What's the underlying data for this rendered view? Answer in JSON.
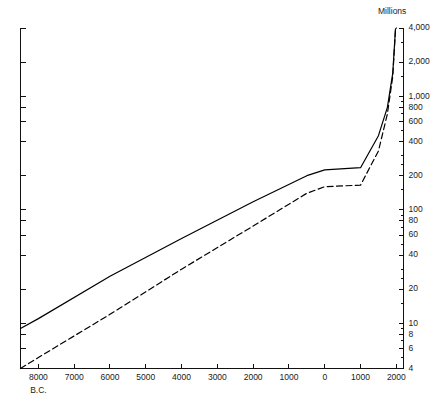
{
  "chart_data": {
    "type": "line",
    "title": "",
    "subtitle": "",
    "xlabel": "",
    "ylabel": "Millions",
    "yscale": "log",
    "ylim": [
      4,
      4000
    ],
    "xlim": [
      -8500,
      2200
    ],
    "grid": false,
    "legend_position": "none",
    "y_unit_label": "Millions",
    "era_label": "B.C.",
    "y_ticks": [
      {
        "value": 4000,
        "label": "4,000"
      },
      {
        "value": 2000,
        "label": "2,000"
      },
      {
        "value": 1000,
        "label": "1,000"
      },
      {
        "value": 800,
        "label": "800"
      },
      {
        "value": 600,
        "label": "600"
      },
      {
        "value": 400,
        "label": "400"
      },
      {
        "value": 200,
        "label": "200"
      },
      {
        "value": 100,
        "label": "100"
      },
      {
        "value": 80,
        "label": "80"
      },
      {
        "value": 60,
        "label": "60"
      },
      {
        "value": 40,
        "label": "40"
      },
      {
        "value": 20,
        "label": "20"
      },
      {
        "value": 10,
        "label": "10"
      },
      {
        "value": 8,
        "label": "8"
      },
      {
        "value": 6,
        "label": "6"
      },
      {
        "value": 4,
        "label": "4"
      }
    ],
    "y_minor_ticks": [
      3000,
      1500,
      900,
      700,
      500,
      300,
      250,
      150,
      90,
      70,
      50,
      30,
      25,
      15,
      9,
      7,
      5
    ],
    "x_ticks": [
      {
        "value": -8000,
        "label": "8000"
      },
      {
        "value": -7000,
        "label": "7000"
      },
      {
        "value": -6000,
        "label": "6000"
      },
      {
        "value": -5000,
        "label": "5000"
      },
      {
        "value": -4000,
        "label": "4000"
      },
      {
        "value": -3000,
        "label": "3000"
      },
      {
        "value": -2000,
        "label": "2000"
      },
      {
        "value": -1000,
        "label": "1000"
      },
      {
        "value": 0,
        "label": "0"
      },
      {
        "value": 1000,
        "label": "1000"
      },
      {
        "value": 2000,
        "label": "2000"
      }
    ],
    "series": [
      {
        "name": "upper-estimate",
        "style": "solid",
        "points": [
          {
            "x": -8500,
            "y": 9
          },
          {
            "x": -8000,
            "y": 11
          },
          {
            "x": -6000,
            "y": 26
          },
          {
            "x": -4000,
            "y": 56
          },
          {
            "x": -2000,
            "y": 118
          },
          {
            "x": -500,
            "y": 200
          },
          {
            "x": 0,
            "y": 225
          },
          {
            "x": 1000,
            "y": 235
          },
          {
            "x": 1500,
            "y": 450
          },
          {
            "x": 1750,
            "y": 800
          },
          {
            "x": 1900,
            "y": 1600
          },
          {
            "x": 1975,
            "y": 3900
          },
          {
            "x": 2000,
            "y": 4000
          }
        ]
      },
      {
        "name": "lower-estimate",
        "style": "dashed",
        "points": [
          {
            "x": -8500,
            "y": 4
          },
          {
            "x": -8000,
            "y": 5
          },
          {
            "x": -6000,
            "y": 12
          },
          {
            "x": -4000,
            "y": 30
          },
          {
            "x": -2000,
            "y": 72
          },
          {
            "x": -500,
            "y": 140
          },
          {
            "x": 0,
            "y": 160
          },
          {
            "x": 1000,
            "y": 165
          },
          {
            "x": 1500,
            "y": 330
          },
          {
            "x": 1750,
            "y": 700
          },
          {
            "x": 1900,
            "y": 1500
          },
          {
            "x": 1975,
            "y": 3800
          },
          {
            "x": 2000,
            "y": 3950
          }
        ]
      }
    ]
  },
  "colors": {
    "ink": "#111111",
    "background": "#ffffff"
  }
}
